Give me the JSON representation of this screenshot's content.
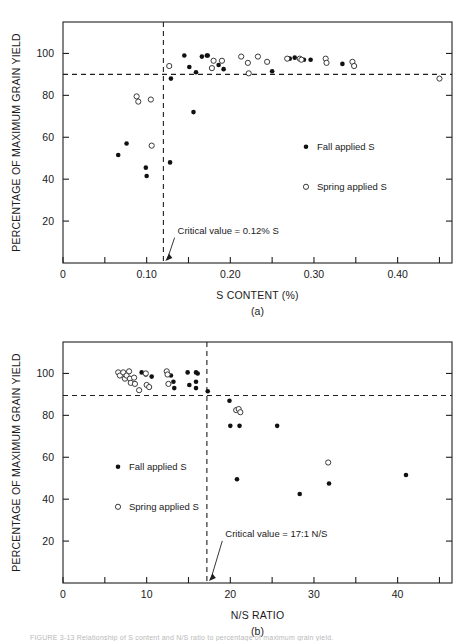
{
  "figure": {
    "panel_a_label": "(a)",
    "panel_b_label": "(b)",
    "caption": "FIGURE 3-13   Relationship of S content and N/S ratio to percentage of maximum grain yield."
  },
  "chart_data": [
    {
      "type": "scatter",
      "id": "panel-a",
      "title": "",
      "xlabel": "S CONTENT (%)",
      "ylabel": "PERCENTAGE OF MAXIMUM GRAIN YIELD",
      "xlim": [
        0,
        0.465
      ],
      "ylim": [
        0,
        115
      ],
      "xticks": [
        0,
        0.05,
        0.1,
        0.15,
        0.2,
        0.25,
        0.3,
        0.35,
        0.4,
        0.45
      ],
      "xtick_labels": [
        "0",
        "",
        "0.10",
        "",
        "0.20",
        "",
        "0.30",
        "",
        "0.40",
        ""
      ],
      "yticks": [
        20,
        40,
        60,
        80,
        100
      ],
      "ytick_labels": [
        "20",
        "40",
        "60",
        "80",
        "100"
      ],
      "grid": false,
      "legend_position": "inside-right",
      "reference_lines": [
        {
          "orient": "vertical",
          "value": 0.12,
          "style": "dashed",
          "label": "Critical value = 0.12% S"
        },
        {
          "orient": "horizontal",
          "value": 90,
          "style": "dashed",
          "label": ""
        }
      ],
      "annotation": {
        "text": "Critical value = 0.12% S",
        "x": 0.137,
        "y": 14
      },
      "series": [
        {
          "name": "Fall applied S",
          "marker": "filled-circle",
          "points": [
            [
              0.066,
              51.5
            ],
            [
              0.076,
              57.0
            ],
            [
              0.099,
              45.5
            ],
            [
              0.1,
              41.5
            ],
            [
              0.128,
              48.0
            ],
            [
              0.129,
              88.0
            ],
            [
              0.145,
              99.0
            ],
            [
              0.151,
              93.5
            ],
            [
              0.156,
              72.0
            ],
            [
              0.159,
              91.0
            ],
            [
              0.166,
              98.5
            ],
            [
              0.172,
              99.0
            ],
            [
              0.173,
              99.0
            ],
            [
              0.186,
              94.5
            ],
            [
              0.192,
              92.5
            ],
            [
              0.25,
              91.5
            ],
            [
              0.271,
              97.5
            ],
            [
              0.277,
              98.0
            ],
            [
              0.288,
              97.0
            ],
            [
              0.296,
              97.0
            ],
            [
              0.334,
              95.0
            ]
          ]
        },
        {
          "name": "Spring applied S",
          "marker": "open-circle",
          "points": [
            [
              0.088,
              79.5
            ],
            [
              0.09,
              77.0
            ],
            [
              0.105,
              78.0
            ],
            [
              0.106,
              56.0
            ],
            [
              0.127,
              94.0
            ],
            [
              0.178,
              93.0
            ],
            [
              0.18,
              96.5
            ],
            [
              0.19,
              96.5
            ],
            [
              0.213,
              98.5
            ],
            [
              0.221,
              95.5
            ],
            [
              0.222,
              90.5
            ],
            [
              0.233,
              98.5
            ],
            [
              0.244,
              96.0
            ],
            [
              0.268,
              97.5
            ],
            [
              0.283,
              97.5
            ],
            [
              0.285,
              97.0
            ],
            [
              0.314,
              97.5
            ],
            [
              0.315,
              95.5
            ],
            [
              0.346,
              96.0
            ],
            [
              0.348,
              94.0
            ],
            [
              0.45,
              88.0
            ]
          ]
        }
      ]
    },
    {
      "type": "scatter",
      "id": "panel-b",
      "title": "",
      "xlabel": "N/S RATIO",
      "ylabel": "PERCENTAGE OF MAXIMUM GRAIN YIELD",
      "xlim": [
        0,
        46.5
      ],
      "ylim": [
        0,
        115
      ],
      "xticks": [
        0,
        5,
        10,
        15,
        20,
        25,
        30,
        35,
        40,
        45
      ],
      "xtick_labels": [
        "0",
        "",
        "10",
        "",
        "20",
        "",
        "30",
        "",
        "40",
        ""
      ],
      "yticks": [
        20,
        40,
        60,
        80,
        100
      ],
      "ytick_labels": [
        "20",
        "40",
        "60",
        "80",
        "100"
      ],
      "grid": false,
      "legend_position": "inside-left",
      "reference_lines": [
        {
          "orient": "vertical",
          "value": 17.2,
          "style": "dashed",
          "label": "Critical value = 17:1 N/S"
        },
        {
          "orient": "horizontal",
          "value": 89.5,
          "style": "dashed",
          "label": ""
        }
      ],
      "annotation": {
        "text": "Critical value = 17:1 N/S",
        "x": 19.4,
        "y": 22
      },
      "series": [
        {
          "name": "Fall applied S",
          "marker": "filled-circle",
          "points": [
            [
              9.4,
              100.5
            ],
            [
              9.9,
              99.5
            ],
            [
              10.6,
              98.5
            ],
            [
              12.9,
              99.0
            ],
            [
              13.2,
              96.0
            ],
            [
              13.3,
              93.0
            ],
            [
              14.9,
              100.5
            ],
            [
              15.1,
              94.5
            ],
            [
              15.9,
              100.5
            ],
            [
              15.9,
              96.0
            ],
            [
              15.9,
              93.0
            ],
            [
              16.1,
              100.0
            ],
            [
              17.3,
              91.5
            ],
            [
              19.9,
              87.0
            ],
            [
              20.0,
              75.0
            ],
            [
              20.8,
              49.5
            ],
            [
              21.1,
              75.0
            ],
            [
              25.6,
              75.0
            ],
            [
              28.3,
              42.5
            ],
            [
              31.8,
              47.5
            ],
            [
              41.0,
              51.5
            ]
          ]
        },
        {
          "name": "Spring applied S",
          "marker": "open-circle",
          "points": [
            [
              6.6,
              100.5
            ],
            [
              6.8,
              99.0
            ],
            [
              7.2,
              100.5
            ],
            [
              7.4,
              97.5
            ],
            [
              7.6,
              99.0
            ],
            [
              7.9,
              101.0
            ],
            [
              8.0,
              97.5
            ],
            [
              8.1,
              95.5
            ],
            [
              8.5,
              98.0
            ],
            [
              8.6,
              95.0
            ],
            [
              9.1,
              92.0
            ],
            [
              9.9,
              100.0
            ],
            [
              10.0,
              94.5
            ],
            [
              10.3,
              93.5
            ],
            [
              12.4,
              101.0
            ],
            [
              12.5,
              99.5
            ],
            [
              12.6,
              95.0
            ],
            [
              20.7,
              82.5
            ],
            [
              21.0,
              83.0
            ],
            [
              21.2,
              81.5
            ],
            [
              31.7,
              57.5
            ]
          ]
        }
      ]
    }
  ]
}
